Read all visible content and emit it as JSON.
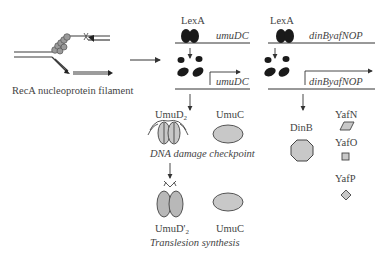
{
  "diagram": {
    "recA": {
      "label": "RecA nucleoprotein filament"
    },
    "operon_left": {
      "repressor": "LexA",
      "gene_repressed": "umuDC",
      "gene_expressed": "umuDC"
    },
    "operon_right": {
      "repressor": "LexA",
      "gene_repressed": "dinByafNOP",
      "gene_expressed": "dinByafNOP"
    },
    "checkpoint": {
      "protein1": "UmuD",
      "protein1_sub": "2",
      "protein2": "UmuC",
      "caption": "DNA damage checkpoint"
    },
    "tls": {
      "protein1": "UmuD'",
      "protein1_sub": "2",
      "protein2": "UmuC",
      "caption": "Translesion synthesis"
    },
    "din_products": {
      "dinB": "DinB",
      "yafN": "YafN",
      "yafO": "YafO",
      "yafP": "YafP"
    },
    "colors": {
      "line": "#3a3a3a",
      "repressor_fill": "#1a1a1a",
      "protein_fill": "#c8c8c8",
      "recA_fill": "#9a9a9a"
    }
  }
}
